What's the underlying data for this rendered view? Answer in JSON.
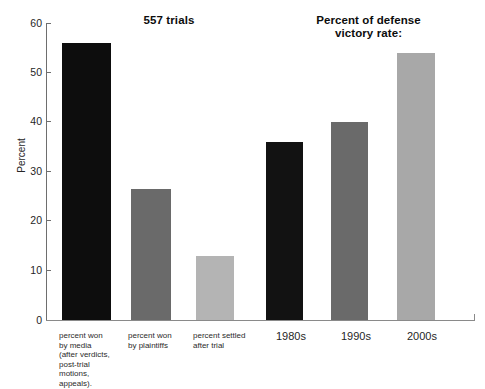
{
  "chart_data": {
    "type": "bar",
    "title": "",
    "xlabel": "",
    "ylabel": "Percent",
    "ylim": [
      0,
      60
    ],
    "yticks": [
      0,
      10,
      20,
      30,
      40,
      50,
      60
    ],
    "grid": false,
    "legend": "none",
    "panels": [
      {
        "title": "557 trials",
        "categories": [
          "percent won\nby media\n(after verdicts,\npost-trial\nmotions,\nappeals).",
          "percent won\nby plaintiffs",
          "percent settled\nafter trial"
        ],
        "values": [
          56,
          26.5,
          13
        ],
        "colors": [
          "#0d0d0d",
          "#6a6a6a",
          "#b4b4b4"
        ]
      },
      {
        "title": "Percent of defense\nvictory rate:",
        "categories": [
          "1980s",
          "1990s",
          "2000s"
        ],
        "values": [
          36,
          40,
          54
        ],
        "colors": [
          "#121212",
          "#6a6a6a",
          "#a8a8a8"
        ]
      }
    ]
  },
  "titles": {
    "left": "557 trials",
    "right_line1": "Percent of defense",
    "right_line2": "victory rate:"
  },
  "axes": {
    "y_label": "Percent",
    "ticks": [
      "60",
      "50",
      "40",
      "30",
      "20",
      "10",
      "0"
    ]
  },
  "labels": {
    "bar1": "percent won\nby media\n(after verdicts,\npost-trial\nmotions,\nappeals).",
    "bar2": "percent won\nby plaintiffs",
    "bar3": "percent settled\nafter trial",
    "bar4": "1980s",
    "bar5": "1990s",
    "bar6": "2000s"
  }
}
